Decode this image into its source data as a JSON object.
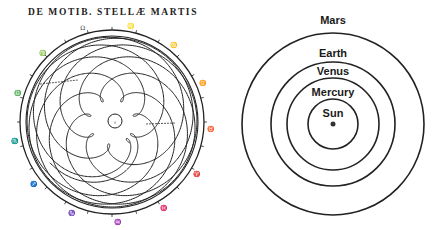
{
  "left_diagram": {
    "title": "DE MOTIB. STELLÆ MARTIS",
    "description": "Geocentric path of Mars (Kepler, Astronomia Nova)",
    "center": [
      112,
      122
    ],
    "outer_radius": 92,
    "inner_ring_radius": 86,
    "center_circle_radius": 7,
    "mars_orbit_px": 53.5,
    "earth_orbit_px": 31.5,
    "mars_period": 1.88,
    "earth_period": 1.0,
    "years": 15.8,
    "center_mark": "♁",
    "tick_labels": [
      "Ω",
      "♌",
      "♋",
      "♊",
      "♉",
      "♈",
      "♓",
      "♒",
      "♑",
      "♐",
      "♏",
      "♎",
      "♍"
    ]
  },
  "right_diagram": {
    "center": [
      333,
      124
    ],
    "bodies": [
      {
        "name": "Mars",
        "radius": 91,
        "label_y": 14
      },
      {
        "name": "Earth",
        "radius": 62,
        "label_y": 47
      },
      {
        "name": "Venus",
        "radius": 46,
        "label_y": 65
      },
      {
        "name": "Mercury",
        "radius": 25,
        "label_y": 86
      },
      {
        "name": "Sun",
        "radius": 0,
        "label_y": 107
      }
    ]
  }
}
